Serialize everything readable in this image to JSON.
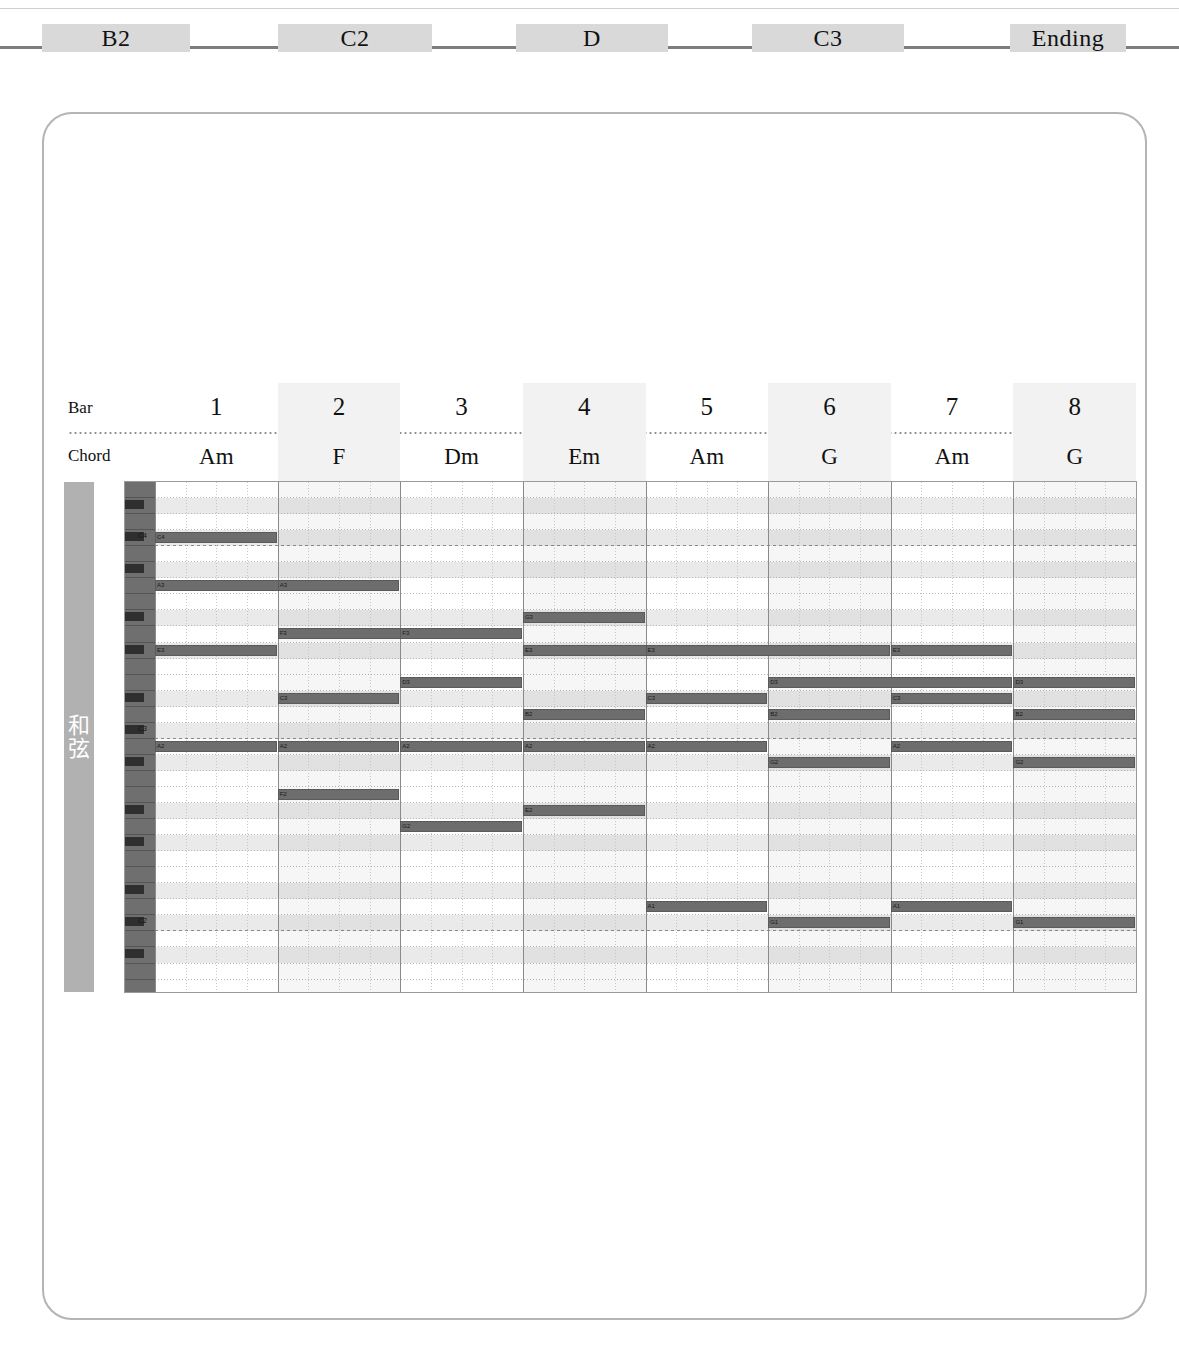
{
  "section_nav": {
    "items": [
      {
        "label": "B2",
        "x": 42,
        "w": 148
      },
      {
        "label": "C2",
        "x": 278,
        "w": 154
      },
      {
        "label": "D",
        "x": 516,
        "w": 152
      },
      {
        "label": "C3",
        "x": 752,
        "w": 152
      },
      {
        "label": "Ending",
        "x": 1010,
        "w": 116
      }
    ]
  },
  "roll": {
    "bar_row_label": "Bar",
    "chord_row_label": "Chord",
    "track_label_line1": "和",
    "track_label_line2": "弦",
    "bars": [
      {
        "number": "1",
        "chord": "Am"
      },
      {
        "number": "2",
        "chord": "F"
      },
      {
        "number": "3",
        "chord": "Dm"
      },
      {
        "number": "4",
        "chord": "Em"
      },
      {
        "number": "5",
        "chord": "Am"
      },
      {
        "number": "6",
        "chord": "G"
      },
      {
        "number": "7",
        "chord": "Am"
      },
      {
        "number": "8",
        "chord": "G"
      }
    ],
    "key_labels": [
      "C4",
      "C3",
      "C2"
    ],
    "accent_color": "#6d6d6d",
    "shade_color": "#f2f2f2"
  },
  "chart_data": {
    "type": "piano-roll",
    "xlabel": "Bar",
    "ylabel": "Pitch",
    "bars": 8,
    "beats_per_bar": 4,
    "pitch_top": "D4",
    "pitch_bottom": "E1",
    "categories": [
      "1",
      "2",
      "3",
      "4",
      "5",
      "6",
      "7",
      "8"
    ],
    "chords": [
      "Am",
      "F",
      "Dm",
      "Em",
      "Am",
      "G",
      "Am",
      "G"
    ],
    "notes": [
      {
        "pitch": "C4",
        "start_bar": 1,
        "length_bars": 1,
        "row": 3
      },
      {
        "pitch": "A3",
        "start_bar": 1,
        "length_bars": 2,
        "row": 6
      },
      {
        "pitch": "E3",
        "start_bar": 1,
        "length_bars": 1,
        "row": 10
      },
      {
        "pitch": "A2",
        "start_bar": 1,
        "length_bars": 1,
        "row": 16
      },
      {
        "pitch": "A3",
        "start_bar": 2,
        "length_bars": 1,
        "row": 6
      },
      {
        "pitch": "F3",
        "start_bar": 2,
        "length_bars": 2,
        "row": 9
      },
      {
        "pitch": "C3",
        "start_bar": 2,
        "length_bars": 1,
        "row": 13
      },
      {
        "pitch": "A2",
        "start_bar": 2,
        "length_bars": 1,
        "row": 16
      },
      {
        "pitch": "F2",
        "start_bar": 2,
        "length_bars": 1,
        "row": 19
      },
      {
        "pitch": "F3",
        "start_bar": 3,
        "length_bars": 1,
        "row": 9
      },
      {
        "pitch": "D3",
        "start_bar": 3,
        "length_bars": 1,
        "row": 12
      },
      {
        "pitch": "A2",
        "start_bar": 3,
        "length_bars": 1,
        "row": 16
      },
      {
        "pitch": "G2",
        "start_bar": 3,
        "length_bars": 1,
        "row": 21
      },
      {
        "pitch": "G3",
        "start_bar": 4,
        "length_bars": 1,
        "row": 8
      },
      {
        "pitch": "E3",
        "start_bar": 4,
        "length_bars": 2,
        "row": 10
      },
      {
        "pitch": "B2",
        "start_bar": 4,
        "length_bars": 1,
        "row": 14
      },
      {
        "pitch": "A2",
        "start_bar": 4,
        "length_bars": 1,
        "row": 16
      },
      {
        "pitch": "E2",
        "start_bar": 4,
        "length_bars": 1,
        "row": 20
      },
      {
        "pitch": "E3",
        "start_bar": 5,
        "length_bars": 2,
        "row": 10
      },
      {
        "pitch": "C3",
        "start_bar": 5,
        "length_bars": 1,
        "row": 13
      },
      {
        "pitch": "A2",
        "start_bar": 5,
        "length_bars": 1,
        "row": 16
      },
      {
        "pitch": "A1",
        "start_bar": 5,
        "length_bars": 1,
        "row": 26
      },
      {
        "pitch": "D3",
        "start_bar": 6,
        "length_bars": 2,
        "row": 12
      },
      {
        "pitch": "B2",
        "start_bar": 6,
        "length_bars": 1,
        "row": 14
      },
      {
        "pitch": "G2",
        "start_bar": 6,
        "length_bars": 1,
        "row": 17
      },
      {
        "pitch": "G1",
        "start_bar": 6,
        "length_bars": 1,
        "row": 27
      },
      {
        "pitch": "E3",
        "start_bar": 7,
        "length_bars": 1,
        "row": 10
      },
      {
        "pitch": "C3",
        "start_bar": 7,
        "length_bars": 1,
        "row": 13
      },
      {
        "pitch": "A2",
        "start_bar": 7,
        "length_bars": 1,
        "row": 16
      },
      {
        "pitch": "A1",
        "start_bar": 7,
        "length_bars": 1,
        "row": 26
      },
      {
        "pitch": "D3",
        "start_bar": 8,
        "length_bars": 1,
        "row": 12
      },
      {
        "pitch": "B2",
        "start_bar": 8,
        "length_bars": 1,
        "row": 14
      },
      {
        "pitch": "G2",
        "start_bar": 8,
        "length_bars": 1,
        "row": 17
      },
      {
        "pitch": "G1",
        "start_bar": 8,
        "length_bars": 1,
        "row": 27
      }
    ]
  }
}
